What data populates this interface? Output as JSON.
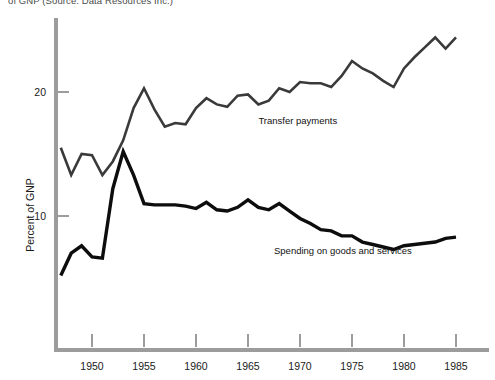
{
  "caption": {
    "top_note": "of GNP (Source: Data Resources Inc.)"
  },
  "chart_data": {
    "type": "line",
    "title": "",
    "subtitle": "",
    "xlabel": "",
    "ylabel": "Percent of GNP",
    "xlim": [
      1947,
      1985
    ],
    "ylim": [
      0,
      27
    ],
    "grid": false,
    "legend_position": "inline-annotations",
    "x_ticks": [
      1950,
      1955,
      1960,
      1965,
      1970,
      1975,
      1980,
      1985
    ],
    "x_tick_labels": [
      "1950",
      "1955",
      "1960",
      "1965",
      "1970",
      "1975",
      "1980",
      "1985"
    ],
    "y_ticks": [
      10,
      20
    ],
    "y_tick_labels": [
      "10",
      "20"
    ],
    "x": [
      1947,
      1948,
      1949,
      1950,
      1951,
      1952,
      1953,
      1954,
      1955,
      1956,
      1957,
      1958,
      1959,
      1960,
      1961,
      1962,
      1963,
      1964,
      1965,
      1966,
      1967,
      1968,
      1969,
      1970,
      1971,
      1972,
      1973,
      1974,
      1975,
      1976,
      1977,
      1978,
      1979,
      1980,
      1981,
      1982,
      1983,
      1984,
      1985
    ],
    "series": [
      {
        "name": "Transfer payments",
        "color": "#3a3a3a",
        "line_width": 2.6,
        "label": "Transfer payments",
        "label_x": 1966.0,
        "label_y": 17.4,
        "values": [
          15.5,
          13.3,
          15.0,
          14.9,
          13.3,
          14.4,
          16.1,
          18.7,
          20.3,
          18.6,
          17.2,
          17.5,
          17.4,
          18.7,
          19.5,
          19.0,
          18.8,
          19.7,
          19.8,
          19.0,
          19.3,
          20.3,
          20.0,
          20.8,
          20.7,
          20.7,
          20.4,
          21.3,
          22.5,
          21.9,
          21.5,
          20.9,
          20.4,
          21.9,
          22.8,
          23.6,
          24.4,
          23.5,
          24.4
        ]
      },
      {
        "name": "Spending on goods and services",
        "color": "#0d0d0d",
        "line_width": 3.4,
        "label": "Spending on goods and services",
        "label_x": 1967.5,
        "label_y": 6.9,
        "values": [
          5.2,
          7.0,
          7.6,
          6.7,
          6.6,
          12.2,
          15.2,
          13.3,
          11.0,
          10.9,
          10.9,
          10.9,
          10.8,
          10.6,
          11.1,
          10.5,
          10.4,
          10.7,
          11.3,
          10.7,
          10.5,
          11.0,
          10.4,
          9.8,
          9.4,
          8.9,
          8.8,
          8.4,
          8.4,
          7.9,
          7.7,
          7.5,
          7.3,
          7.6,
          7.7,
          7.8,
          7.9,
          8.2,
          8.3
        ]
      }
    ]
  },
  "axes": {
    "y_axis_name": "vertical-axis",
    "x_axis_name": "horizontal-axis",
    "axis_color": "#9c9c9c"
  }
}
